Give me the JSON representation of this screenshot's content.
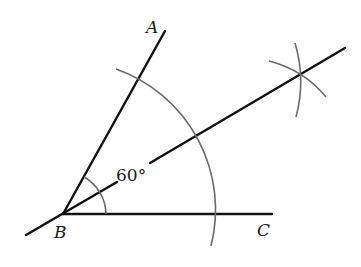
{
  "diagram": {
    "type": "angle-bisector-construction",
    "points": {
      "A": {
        "label": "A",
        "x": 165,
        "y": 31
      },
      "B": {
        "label": "B",
        "x": 63,
        "y": 214
      },
      "C": {
        "label": "C",
        "x": 272,
        "y": 214
      }
    },
    "angle_label": "60°",
    "colors": {
      "line": "#111111",
      "arc": "#6b6b6b",
      "background": "#ffffff"
    }
  }
}
